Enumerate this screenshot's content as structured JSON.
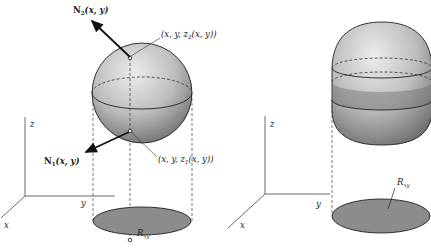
{
  "figure": {
    "left_panel": {
      "axes": {
        "x_label": "x",
        "y_label": "y",
        "z_label": "z"
      },
      "normal_top": {
        "symbol": "N",
        "subscript": "2",
        "args": "(x, y)"
      },
      "normal_bottom": {
        "symbol": "N",
        "subscript": "1",
        "args": "(x, y)"
      },
      "point_top": {
        "prefix": "(x, y, z",
        "subscript": "2",
        "suffix": "(x, y))"
      },
      "point_bottom": {
        "prefix": "(x, y, z",
        "subscript": "1",
        "suffix": "(x, y))"
      },
      "region": {
        "symbol": "R",
        "subscript": "xy"
      }
    },
    "right_panel": {
      "axes": {
        "x_label": "x",
        "y_label": "y",
        "z_label": "z"
      },
      "region": {
        "symbol": "R",
        "subscript": "xy"
      }
    },
    "colors": {
      "line": "#222222",
      "region_fill": "#8a8a8a",
      "sphere_light": "#e2e2e2",
      "sphere_dark": "#7a7a7a"
    }
  }
}
